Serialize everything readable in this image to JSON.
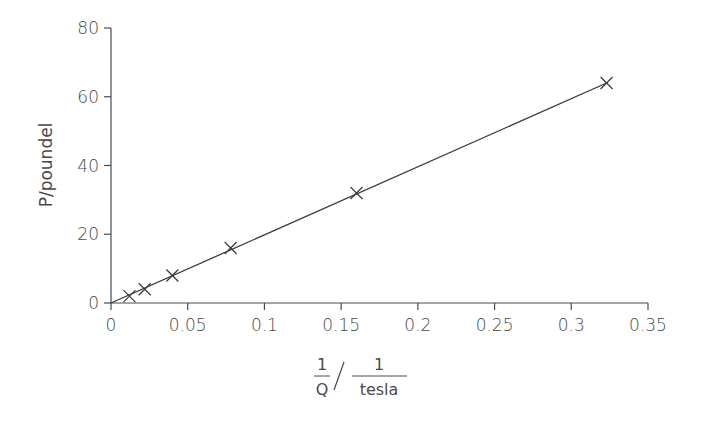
{
  "chart_data": {
    "type": "scatter",
    "title": "",
    "xlabel": "1/Q / 1/tesla",
    "xlabel_parts": {
      "left_numerator": "1",
      "left_denominator": "Q",
      "right_numerator": "1",
      "right_denominator": "tesla"
    },
    "ylabel": "P/poundel",
    "xlim": [
      0,
      0.35
    ],
    "ylim": [
      0,
      80
    ],
    "x_ticks": [
      0,
      0.05,
      0.1,
      0.15,
      0.2,
      0.25,
      0.3,
      0.35
    ],
    "x_tick_labels": [
      "0",
      "0.05",
      "0.1",
      "0.15",
      "0.2",
      "0.25",
      "0.3",
      "0.35"
    ],
    "y_ticks": [
      0,
      20,
      40,
      60,
      80
    ],
    "y_tick_labels": [
      "0",
      "20",
      "40",
      "60",
      "80"
    ],
    "grid": false,
    "legend": null,
    "marker": "x",
    "series": [
      {
        "name": "data",
        "x": [
          0.012,
          0.022,
          0.04,
          0.078,
          0.16,
          0.323
        ],
        "y": [
          2,
          4,
          8,
          16,
          32,
          64
        ]
      }
    ],
    "fit_line": {
      "from": [
        0,
        0
      ],
      "to": [
        0.323,
        64
      ]
    }
  }
}
